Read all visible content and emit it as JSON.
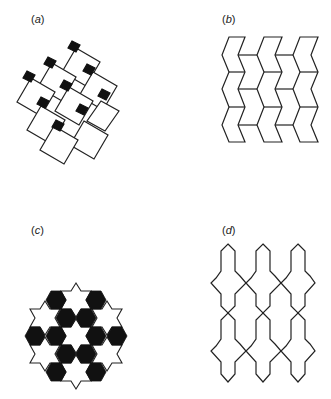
{
  "figure": {
    "panels": [
      {
        "id": "a",
        "label_open": "(",
        "label_letter": "a",
        "label_close": ")",
        "description": "Tiling of tilted white squares with small black squares at corners"
      },
      {
        "id": "b",
        "label_open": "(",
        "label_letter": "b",
        "label_close": ")",
        "description": "Tiling of chevron-shaped hexagons in three columns"
      },
      {
        "id": "c",
        "label_open": "(",
        "label_letter": "c",
        "label_close": ")",
        "description": "Hexagonal patch of white six-pointed stars and black hexagons"
      },
      {
        "id": "d",
        "label_open": "(",
        "label_letter": "d",
        "label_close": ")",
        "description": "Interlocking elongated cross-shaped outlines in three columns, two rows"
      }
    ],
    "colors": {
      "stroke": "#222222",
      "fill_black": "#111111",
      "fill_white": "#ffffff",
      "label": "#222222"
    }
  }
}
